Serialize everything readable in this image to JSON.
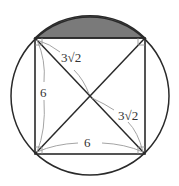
{
  "figure": {
    "colors": {
      "stroke": "#2a2a2a",
      "shade": "#7a7a7a",
      "dimension": "#9a9a9a",
      "background": "#ffffff"
    },
    "labels": {
      "half_diagonal_upper": "3√2",
      "half_diagonal_lower": "3√2",
      "left_side": "6",
      "bottom_side": "6"
    }
  }
}
